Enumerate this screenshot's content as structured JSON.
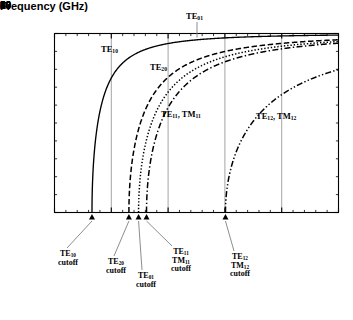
{
  "chart_data": {
    "type": "line",
    "title": "",
    "xlabel": "Frequency (GHz)",
    "ylabel": "β/k",
    "xlim": [
      0,
      50
    ],
    "ylim": [
      0,
      1
    ],
    "xticks": [
      0,
      10,
      20,
      30,
      40,
      50
    ],
    "xticklabels": [
      "0",
      "10",
      "20",
      "30",
      "40",
      "50"
    ],
    "xminor_step": 2,
    "yticks": [
      0,
      1
    ],
    "yticklabels": [
      "0",
      "1"
    ],
    "yminor_step": 0.1,
    "grid": "vertical gridlines at x = 10, 20, 30, 40",
    "legend": "none (inline curve labels)",
    "equation": "beta/k = sqrt(1 - (fc/f)^2)",
    "series": [
      {
        "name": "TE10",
        "label": "TE₁₀",
        "cutoff_ghz": 6.6,
        "linestyle": "solid",
        "points": [
          {
            "f": 6.6,
            "y": 0.0
          },
          {
            "f": 6.8,
            "y": 0.24
          },
          {
            "f": 7.0,
            "y": 0.33
          },
          {
            "f": 7.5,
            "y": 0.47
          },
          {
            "f": 8.0,
            "y": 0.56
          },
          {
            "f": 9.0,
            "y": 0.68
          },
          {
            "f": 10.0,
            "y": 0.75
          },
          {
            "f": 12.0,
            "y": 0.84
          },
          {
            "f": 14.0,
            "y": 0.88
          },
          {
            "f": 17.0,
            "y": 0.92
          },
          {
            "f": 20.0,
            "y": 0.95
          },
          {
            "f": 25.0,
            "y": 0.965
          },
          {
            "f": 30.0,
            "y": 0.976
          },
          {
            "f": 40.0,
            "y": 0.986
          },
          {
            "f": 50.0,
            "y": 0.991
          }
        ]
      },
      {
        "name": "TE20",
        "label": "TE₂₀",
        "cutoff_ghz": 13.1,
        "linestyle": "dashed",
        "points": [
          {
            "f": 13.1,
            "y": 0.0
          },
          {
            "f": 13.5,
            "y": 0.24
          },
          {
            "f": 14.0,
            "y": 0.35
          },
          {
            "f": 15.0,
            "y": 0.49
          },
          {
            "f": 16.0,
            "y": 0.57
          },
          {
            "f": 18.0,
            "y": 0.69
          },
          {
            "f": 20.0,
            "y": 0.76
          },
          {
            "f": 24.0,
            "y": 0.84
          },
          {
            "f": 28.0,
            "y": 0.89
          },
          {
            "f": 34.0,
            "y": 0.925
          },
          {
            "f": 40.0,
            "y": 0.945
          },
          {
            "f": 50.0,
            "y": 0.965
          }
        ]
      },
      {
        "name": "TE01",
        "label": "TE₀₁",
        "cutoff_ghz": 14.8,
        "linestyle": "dotted",
        "points": [
          {
            "f": 14.8,
            "y": 0.0
          },
          {
            "f": 15.2,
            "y": 0.23
          },
          {
            "f": 15.8,
            "y": 0.35
          },
          {
            "f": 17.0,
            "y": 0.49
          },
          {
            "f": 18.0,
            "y": 0.57
          },
          {
            "f": 20.0,
            "y": 0.67
          },
          {
            "f": 23.0,
            "y": 0.765
          },
          {
            "f": 27.0,
            "y": 0.835
          },
          {
            "f": 32.0,
            "y": 0.885
          },
          {
            "f": 38.0,
            "y": 0.92
          },
          {
            "f": 44.0,
            "y": 0.942
          },
          {
            "f": 50.0,
            "y": 0.956
          }
        ]
      },
      {
        "name": "TE11_TM11",
        "label": "TE₁₁, TM₁₁",
        "cutoff_ghz": 16.2,
        "linestyle": "dashdot",
        "points": [
          {
            "f": 16.2,
            "y": 0.0
          },
          {
            "f": 16.6,
            "y": 0.22
          },
          {
            "f": 17.2,
            "y": 0.34
          },
          {
            "f": 18.5,
            "y": 0.48
          },
          {
            "f": 20.0,
            "y": 0.59
          },
          {
            "f": 22.0,
            "y": 0.68
          },
          {
            "f": 25.0,
            "y": 0.762
          },
          {
            "f": 29.0,
            "y": 0.83
          },
          {
            "f": 34.0,
            "y": 0.88
          },
          {
            "f": 40.0,
            "y": 0.915
          },
          {
            "f": 45.0,
            "y": 0.933
          },
          {
            "f": 50.0,
            "y": 0.947
          }
        ]
      },
      {
        "name": "TE12_TM12",
        "label": "TE₁₂, TM₁₂",
        "cutoff_ghz": 30.1,
        "linestyle": "dashdotdot",
        "points": [
          {
            "f": 30.1,
            "y": 0.0
          },
          {
            "f": 30.8,
            "y": 0.21
          },
          {
            "f": 31.5,
            "y": 0.29
          },
          {
            "f": 33.0,
            "y": 0.41
          },
          {
            "f": 35.0,
            "y": 0.51
          },
          {
            "f": 37.0,
            "y": 0.58
          },
          {
            "f": 40.0,
            "y": 0.66
          },
          {
            "f": 43.0,
            "y": 0.715
          },
          {
            "f": 46.0,
            "y": 0.757
          },
          {
            "f": 48.0,
            "y": 0.78
          },
          {
            "f": 50.0,
            "y": 0.8
          }
        ]
      }
    ],
    "curve_labels": [
      {
        "id": "te10",
        "text_main": "TE",
        "text_sub": "10"
      },
      {
        "id": "te20",
        "text_main": "TE",
        "text_sub": "20"
      },
      {
        "id": "te01",
        "text_main": "TE",
        "text_sub": "01"
      },
      {
        "id": "te11tm11",
        "text_main_a": "TE",
        "text_sub_a": "11",
        "sep": ", ",
        "text_main_b": "TM",
        "text_sub_b": "11"
      },
      {
        "id": "te12tm12",
        "text_main_a": "TE",
        "text_sub_a": "12",
        "sep": ", ",
        "text_main_b": "TM",
        "text_sub_b": "12"
      }
    ],
    "cutoff_annotations": [
      {
        "id": "te10-cutoff",
        "mode": "TE",
        "sub": "10",
        "second_mode": "",
        "second_sub": "",
        "word": "cutoff",
        "x_ghz": 6.6
      },
      {
        "id": "te20-cutoff",
        "mode": "TE",
        "sub": "20",
        "second_mode": "",
        "second_sub": "",
        "word": "cutoff",
        "x_ghz": 13.1
      },
      {
        "id": "te01-cutoff",
        "mode": "TE",
        "sub": "01",
        "second_mode": "",
        "second_sub": "",
        "word": "cutoff",
        "x_ghz": 14.8
      },
      {
        "id": "te11tm11-cutoff",
        "mode": "TE",
        "sub": "11",
        "second_mode": "TM",
        "second_sub": "11",
        "word": "cutoff",
        "x_ghz": 16.2
      },
      {
        "id": "te12tm12-cutoff",
        "mode": "TE",
        "sub": "12",
        "second_mode": "TM",
        "second_sub": "12",
        "word": "cutoff",
        "x_ghz": 30.1
      }
    ],
    "colors": {
      "axis": "#000000",
      "curve": "#000000",
      "grid": "#9a9a9a",
      "background": "#ffffff"
    }
  }
}
